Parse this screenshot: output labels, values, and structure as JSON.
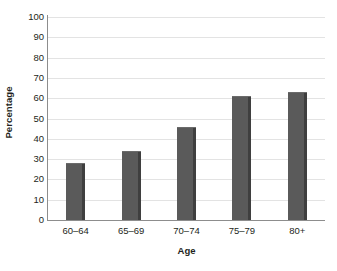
{
  "chart_data": {
    "type": "bar",
    "title": "",
    "subtitle": "",
    "categories": [
      "60–64",
      "65–69",
      "70–74",
      "75–79",
      "80+"
    ],
    "values": [
      28,
      34,
      46,
      61,
      63
    ],
    "xlabel": "Age",
    "ylabel": "Percentage",
    "ylim": [
      0,
      100
    ],
    "ytick_step": 10,
    "ytick_labels": [
      "0",
      "10",
      "20",
      "30",
      "40",
      "50",
      "60",
      "70",
      "80",
      "90",
      "100"
    ],
    "grid": true,
    "grid_axis": "y",
    "legend": false,
    "legend_position": "none",
    "series": [
      {
        "name": "Percentage",
        "values": [
          28,
          34,
          46,
          61,
          63
        ]
      }
    ],
    "annotations": [],
    "colors": {
      "bar_face": "#5a5a5a",
      "bar_side": "#3f3f3f",
      "bar_top": "#6b6b6b",
      "gridline": "#e3e3e3",
      "axis_line": "#8d8d8d",
      "text": "#231f20",
      "background": "#ffffff"
    }
  }
}
